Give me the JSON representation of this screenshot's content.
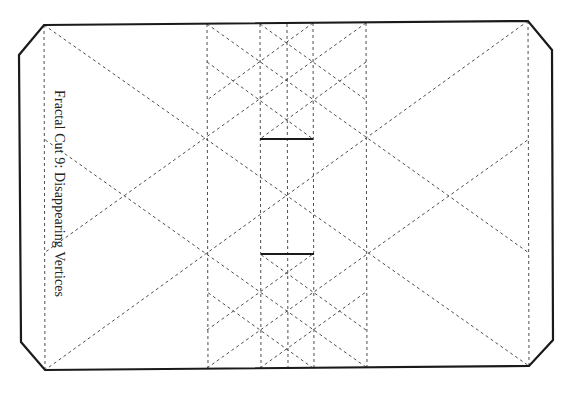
{
  "figure": {
    "title": "Fractal Cut 9: Disappearing Vertices",
    "cut_color": "#1a1a1a",
    "fold_color": "#3a3a3a",
    "background": "#ffffff"
  }
}
